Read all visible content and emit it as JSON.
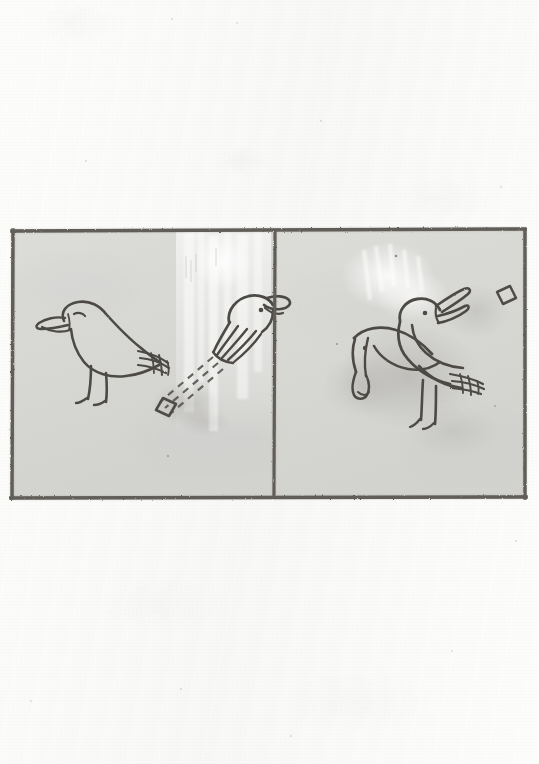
{
  "document": {
    "kind": "manuscript-folio-scan",
    "page_background_color": "#fdfdfc",
    "ink_color": "#4a4743",
    "frame_color": "#5d5a54",
    "panel_fill_color": "#d9d9d6",
    "caption": ""
  },
  "illustration": {
    "name": "two-panel-bird-scene",
    "frame": {
      "x": 8,
      "y": 226,
      "width": 521,
      "height": 277,
      "stroke_color": "#5f5c55",
      "divider_x_ratio": 0.512
    },
    "panels": [
      {
        "id": "panel-left",
        "label": "Left panel",
        "background_color": "#d9d9d6",
        "figures": [
          {
            "id": "bird-standing-left",
            "name": "standing-bird-figure",
            "description": "Standing bird in profile facing left, long open beak, striped tail, two legs",
            "facing": "left"
          },
          {
            "id": "bird-head-right",
            "name": "bird-head-figure",
            "description": "Disembodied bird head facing right with feathered neck and eye dot",
            "facing": "right"
          },
          {
            "id": "speech-scroll-left",
            "name": "dashed-speech-lines",
            "description": "Three dashed lines running diagonally from the bird head down-left to a small diamond glyph"
          },
          {
            "id": "diamond-glyph-left",
            "name": "diamond-glyph",
            "description": "Small outlined diamond / lozenge glyph"
          },
          {
            "id": "scrape-left",
            "name": "erasure-scrape-area",
            "description": "Vertical pale scraped/abraded streak in the parchment"
          }
        ]
      },
      {
        "id": "panel-right",
        "label": "Right panel",
        "background_color": "#d9d9d6",
        "figures": [
          {
            "id": "bird-front-right",
            "name": "bird-open-beak-figure",
            "description": "Bird with head raised and beak open facing up-right, striped tail, two legs",
            "facing": "right"
          },
          {
            "id": "bird-behind-right",
            "name": "bird-bowing-figure",
            "description": "Second bird overlapping behind, head lowered toward the ground at left",
            "facing": "left"
          },
          {
            "id": "diamond-glyph-right",
            "name": "diamond-glyph",
            "description": "Small outlined diamond / lozenge glyph at upper right"
          },
          {
            "id": "scrape-right",
            "name": "erasure-scrape-area",
            "description": "Pale scraped / rubbed patch behind the birds"
          },
          {
            "id": "smudge-right",
            "name": "ink-smudge",
            "description": "Diffuse grey smudge under and around the birds"
          }
        ]
      }
    ]
  }
}
